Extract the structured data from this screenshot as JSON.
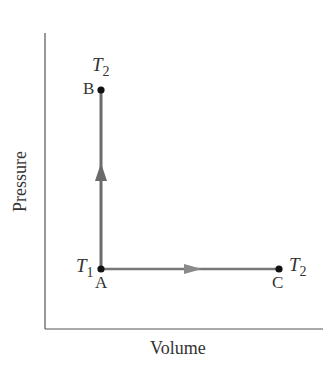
{
  "diagram": {
    "title": "",
    "x_axis_label": "Volume",
    "y_axis_label": "Pressure",
    "points": [
      {
        "id": "A",
        "label": "A",
        "temp_label": "T",
        "temp_sub": "1",
        "x": 101,
        "y": 269
      },
      {
        "id": "B",
        "label": "B",
        "temp_label": "T",
        "temp_sub": "2",
        "x": 101,
        "y": 90
      },
      {
        "id": "C",
        "label": "C",
        "temp_label": "T",
        "temp_sub": "2",
        "x": 279,
        "y": 269
      }
    ],
    "paths": [
      {
        "from": "A",
        "to": "B",
        "direction": "up",
        "kind": "constant volume"
      },
      {
        "from": "A",
        "to": "C",
        "direction": "right",
        "kind": "constant pressure"
      }
    ],
    "colors": {
      "axis": "#555555",
      "path": "#6b6b6b",
      "arrow": "#7a7a7a",
      "dot": "#111111",
      "text": "#333333"
    }
  }
}
